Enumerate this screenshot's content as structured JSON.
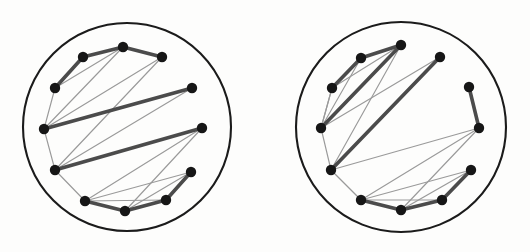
{
  "figure": {
    "background_color": "#fdfdfc",
    "boundary_color": "#1b1b1b",
    "thick_edge_color": "#4b4b4b",
    "thin_edge_color": "#9a9a9a",
    "vertex_color": "#161616",
    "vertex_radius": 5.2,
    "thick_edge_width": 3.6,
    "thin_edge_width": 1.15,
    "boundary_width": 2.1,
    "panel_count": 2
  },
  "chart_data": {
    "type": "diagram",
    "title": "",
    "subtitle": "",
    "xlabel": "",
    "ylabel": "",
    "panels": [
      {
        "name": "left-panel",
        "label": "",
        "circle": {
          "cx": 127,
          "cy": 127,
          "r": 104
        },
        "vertices": [
          {
            "id": 0,
            "x": 123,
            "y": 47
          },
          {
            "id": 1,
            "x": 162,
            "y": 57
          },
          {
            "id": 2,
            "x": 192,
            "y": 88
          },
          {
            "id": 3,
            "x": 202,
            "y": 128
          },
          {
            "id": 4,
            "x": 191,
            "y": 172
          },
          {
            "id": 5,
            "x": 166,
            "y": 200
          },
          {
            "id": 6,
            "x": 125,
            "y": 211
          },
          {
            "id": 7,
            "x": 85,
            "y": 201
          },
          {
            "id": 8,
            "x": 55,
            "y": 170
          },
          {
            "id": 9,
            "x": 44,
            "y": 129
          },
          {
            "id": 10,
            "x": 55,
            "y": 88
          },
          {
            "id": 11,
            "x": 83,
            "y": 57
          }
        ],
        "edges_thick": [
          {
            "from": 0,
            "to": 1
          },
          {
            "from": 11,
            "to": 0
          },
          {
            "from": 10,
            "to": 11
          },
          {
            "from": 9,
            "to": 2
          },
          {
            "from": 8,
            "to": 3
          },
          {
            "from": 7,
            "to": 6
          },
          {
            "from": 6,
            "to": 5
          },
          {
            "from": 5,
            "to": 4
          }
        ],
        "edges_thin": [
          {
            "from": 10,
            "to": 9
          },
          {
            "from": 9,
            "to": 8
          },
          {
            "from": 8,
            "to": 7
          },
          {
            "from": 9,
            "to": 0
          },
          {
            "from": 9,
            "to": 1
          },
          {
            "from": 10,
            "to": 0
          },
          {
            "from": 8,
            "to": 2
          },
          {
            "from": 8,
            "to": 1
          },
          {
            "from": 7,
            "to": 3
          },
          {
            "from": 7,
            "to": 4
          },
          {
            "from": 6,
            "to": 3
          },
          {
            "from": 6,
            "to": 4
          },
          {
            "from": 7,
            "to": 5
          }
        ]
      },
      {
        "name": "right-panel",
        "label": "",
        "circle": {
          "cx": 401,
          "cy": 127,
          "r": 105
        },
        "vertices": [
          {
            "id": 0,
            "x": 401,
            "y": 45
          },
          {
            "id": 1,
            "x": 440,
            "y": 57
          },
          {
            "id": 2,
            "x": 469,
            "y": 87
          },
          {
            "id": 3,
            "x": 479,
            "y": 128
          },
          {
            "id": 4,
            "x": 471,
            "y": 170
          },
          {
            "id": 5,
            "x": 442,
            "y": 200
          },
          {
            "id": 6,
            "x": 401,
            "y": 210
          },
          {
            "id": 7,
            "x": 361,
            "y": 200
          },
          {
            "id": 8,
            "x": 331,
            "y": 170
          },
          {
            "id": 9,
            "x": 321,
            "y": 128
          },
          {
            "id": 10,
            "x": 332,
            "y": 88
          },
          {
            "id": 11,
            "x": 361,
            "y": 58
          }
        ],
        "edges_thick": [
          {
            "from": 11,
            "to": 0
          },
          {
            "from": 10,
            "to": 11
          },
          {
            "from": 9,
            "to": 0
          },
          {
            "from": 8,
            "to": 1
          },
          {
            "from": 2,
            "to": 3
          },
          {
            "from": 7,
            "to": 6
          },
          {
            "from": 6,
            "to": 5
          },
          {
            "from": 5,
            "to": 4
          }
        ],
        "edges_thin": [
          {
            "from": 10,
            "to": 9
          },
          {
            "from": 9,
            "to": 8
          },
          {
            "from": 8,
            "to": 7
          },
          {
            "from": 9,
            "to": 11
          },
          {
            "from": 9,
            "to": 10
          },
          {
            "from": 10,
            "to": 0
          },
          {
            "from": 9,
            "to": 1
          },
          {
            "from": 8,
            "to": 0
          },
          {
            "from": 8,
            "to": 3
          },
          {
            "from": 7,
            "to": 3
          },
          {
            "from": 7,
            "to": 4
          },
          {
            "from": 6,
            "to": 4
          },
          {
            "from": 7,
            "to": 5
          },
          {
            "from": 6,
            "to": 3
          }
        ]
      }
    ]
  }
}
